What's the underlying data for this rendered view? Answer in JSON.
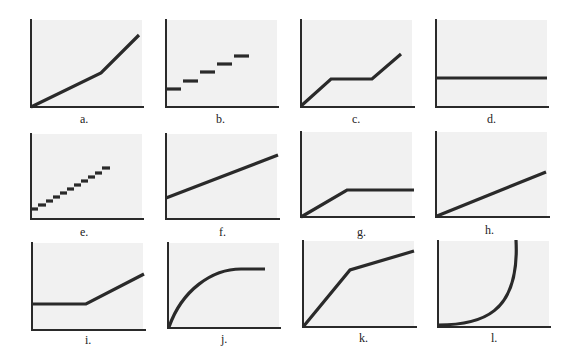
{
  "figure": {
    "axes_color": "#2a2a2a",
    "line_color": "#2a2a2a",
    "panel_background": "#f1f1f1"
  },
  "panels": [
    {
      "id": "a",
      "label": "a.",
      "shape": "piecewise-linear: gentle slope then steeper slope"
    },
    {
      "id": "b",
      "label": "b.",
      "shape": "5-step staircase (horizontal dashes increasing)"
    },
    {
      "id": "c",
      "label": "c.",
      "shape": "rise, flat plateau, rise"
    },
    {
      "id": "d",
      "label": "d.",
      "shape": "constant horizontal line"
    },
    {
      "id": "e",
      "label": "e.",
      "shape": "11-step fine staircase increasing"
    },
    {
      "id": "f",
      "label": "f.",
      "shape": "straight line with positive intercept"
    },
    {
      "id": "g",
      "label": "g.",
      "shape": "rise from origin then flat"
    },
    {
      "id": "h",
      "label": "h.",
      "shape": "straight line from origin"
    },
    {
      "id": "i",
      "label": "i.",
      "shape": "flat then rising"
    },
    {
      "id": "j",
      "label": "j.",
      "shape": "concave curve saturating (diminishing growth)"
    },
    {
      "id": "k",
      "label": "k.",
      "shape": "steep rise from origin then shallower rise"
    },
    {
      "id": "l",
      "label": "l.",
      "shape": "convex curve rising to vertical (accelerating growth)"
    }
  ]
}
